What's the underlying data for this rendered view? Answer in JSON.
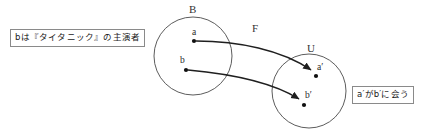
{
  "diagram": {
    "sets": [
      {
        "id": "B",
        "label": "B",
        "cx": 193,
        "cy": 56,
        "r": 39,
        "points": [
          {
            "id": "a",
            "label": "a",
            "x": 194,
            "y": 41
          },
          {
            "id": "b",
            "label": "b",
            "x": 186,
            "y": 70
          }
        ]
      },
      {
        "id": "U",
        "label": "U",
        "cx": 309,
        "cy": 91,
        "r": 37,
        "points": [
          {
            "id": "a_prime",
            "label": "a′",
            "x": 316,
            "y": 76
          },
          {
            "id": "b_prime",
            "label": "b′",
            "x": 304,
            "y": 105
          }
        ]
      }
    ],
    "mapping": {
      "label": "F",
      "arrows": [
        {
          "from": "a",
          "to": "a_prime"
        },
        {
          "from": "b",
          "to": "b_prime"
        }
      ]
    },
    "annotations": [
      {
        "id": "left-annotation",
        "text": "bは『タイタニック』の主演者"
      },
      {
        "id": "right-annotation",
        "text": "a′がb′に会う"
      }
    ],
    "colors": {
      "stroke": "#4a4a4a",
      "arrow": "#1f1f1f",
      "box_border": "#8a8a8a",
      "text": "#1a1a1a",
      "background": "#ffffff"
    }
  }
}
